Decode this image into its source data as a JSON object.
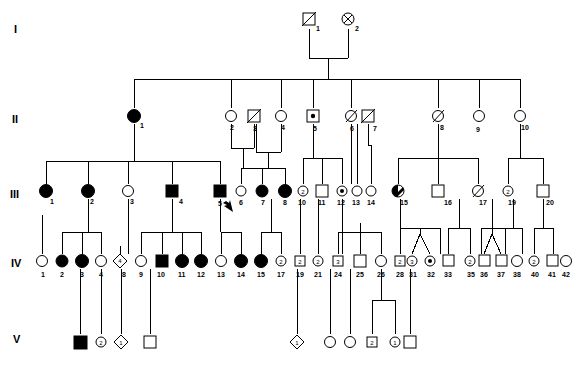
{
  "figure": {
    "type": "pedigree-chart",
    "title": "",
    "width": 576,
    "height": 366,
    "background": "#ffffff",
    "line_color": "#000000",
    "fill_affected": "#000000",
    "fill_unaffected": "#ffffff"
  },
  "generation_labels": [
    {
      "text": "I",
      "x": 14,
      "y": 32
    },
    {
      "text": "II",
      "x": 12,
      "y": 122
    },
    {
      "text": "III",
      "x": 10,
      "y": 197
    },
    {
      "text": "IV",
      "x": 11,
      "y": 266
    },
    {
      "text": "V",
      "x": 13,
      "y": 342
    }
  ],
  "legend_meaning": {
    "square": "male",
    "circle": "female",
    "diamond": "sex unknown",
    "filled": "affected",
    "open": "unaffected",
    "center_dot": "carrier",
    "diagonal_slash": "deceased",
    "circle_with_x": "deceased female",
    "half_filled": "partially affected",
    "number_inside": "number of individuals",
    "arrow": "proband"
  },
  "individuals": [
    {
      "gen": "I",
      "id": "1",
      "shape": "square",
      "fill": "open",
      "mark": "slash",
      "x": 309,
      "y": 19
    },
    {
      "gen": "I",
      "id": "2",
      "shape": "circle",
      "fill": "open",
      "mark": "cross",
      "x": 348,
      "y": 19
    },
    {
      "gen": "II",
      "id": "1",
      "shape": "circle",
      "fill": "filled",
      "mark": "none",
      "x": 134,
      "y": 116
    },
    {
      "gen": "II",
      "id": "2",
      "shape": "circle",
      "fill": "open",
      "mark": "none",
      "x": 231,
      "y": 116
    },
    {
      "gen": "II",
      "id": "3",
      "shape": "square",
      "fill": "open",
      "mark": "slash",
      "x": 254,
      "y": 116
    },
    {
      "gen": "II",
      "id": "4",
      "shape": "circle",
      "fill": "open",
      "mark": "none",
      "x": 281,
      "y": 116
    },
    {
      "gen": "II",
      "id": "5",
      "shape": "square",
      "fill": "open",
      "mark": "dot",
      "x": 313,
      "y": 116
    },
    {
      "gen": "II",
      "id": "6",
      "shape": "circle",
      "fill": "open",
      "mark": "slash",
      "x": 351,
      "y": 116
    },
    {
      "gen": "II",
      "id": "7",
      "shape": "square",
      "fill": "open",
      "mark": "slash",
      "x": 368,
      "y": 116
    },
    {
      "gen": "II",
      "id": "8",
      "shape": "circle",
      "fill": "open",
      "mark": "slash",
      "x": 438,
      "y": 116
    },
    {
      "gen": "II",
      "id": "9",
      "shape": "circle",
      "fill": "open",
      "mark": "none",
      "x": 479,
      "y": 116
    },
    {
      "gen": "II",
      "id": "10",
      "shape": "circle",
      "fill": "open",
      "mark": "none",
      "x": 520,
      "y": 116
    },
    {
      "gen": "III",
      "id": "1",
      "shape": "circle",
      "fill": "filled",
      "mark": "none",
      "x": 46,
      "y": 191
    },
    {
      "gen": "III",
      "id": "2",
      "shape": "circle",
      "fill": "filled",
      "mark": "none",
      "x": 88,
      "y": 191
    },
    {
      "gen": "III",
      "id": "3",
      "shape": "circle",
      "fill": "open",
      "mark": "none",
      "x": 128,
      "y": 191
    },
    {
      "gen": "III",
      "id": "4",
      "shape": "square",
      "fill": "filled",
      "mark": "none",
      "x": 172,
      "y": 191
    },
    {
      "gen": "III",
      "id": "5",
      "shape": "square",
      "fill": "filled",
      "mark": "proband",
      "x": 220,
      "y": 191
    },
    {
      "gen": "III",
      "id": "6",
      "shape": "circle",
      "fill": "open",
      "mark": "none",
      "x": 241,
      "y": 191
    },
    {
      "gen": "III",
      "id": "7",
      "shape": "circle",
      "fill": "filled",
      "mark": "none",
      "x": 262,
      "y": 191
    },
    {
      "gen": "III",
      "id": "8",
      "shape": "circle",
      "fill": "filled",
      "mark": "none",
      "x": 285,
      "y": 191
    },
    {
      "gen": "III",
      "id": "10",
      "shape": "circle",
      "fill": "open",
      "mark": "count",
      "count": "2",
      "x": 303,
      "y": 191
    },
    {
      "gen": "III",
      "id": "11",
      "shape": "square",
      "fill": "open",
      "mark": "none",
      "x": 322,
      "y": 191
    },
    {
      "gen": "III",
      "id": "12",
      "shape": "circle",
      "fill": "open",
      "mark": "dot",
      "x": 342,
      "y": 191
    },
    {
      "gen": "III",
      "id": "13",
      "shape": "circle",
      "fill": "open",
      "mark": "none",
      "x": 357,
      "y": 191
    },
    {
      "gen": "III",
      "id": "14",
      "shape": "circle",
      "fill": "open",
      "mark": "none",
      "x": 371,
      "y": 191
    },
    {
      "gen": "III",
      "id": "15",
      "shape": "circle",
      "fill": "half",
      "mark": "none",
      "x": 398,
      "y": 191
    },
    {
      "gen": "III",
      "id": "16",
      "shape": "square",
      "fill": "open",
      "mark": "none",
      "x": 438,
      "y": 191
    },
    {
      "gen": "III",
      "id": "17",
      "shape": "circle",
      "fill": "open",
      "mark": "slash",
      "x": 478,
      "y": 191
    },
    {
      "gen": "III",
      "id": "19",
      "shape": "circle",
      "fill": "open",
      "mark": "count",
      "count": "2",
      "x": 508,
      "y": 191
    },
    {
      "gen": "III",
      "id": "20",
      "shape": "square",
      "fill": "open",
      "mark": "none",
      "x": 543,
      "y": 191
    },
    {
      "gen": "IV",
      "id": "1",
      "shape": "circle",
      "fill": "open",
      "mark": "none",
      "x": 42,
      "y": 261
    },
    {
      "gen": "IV",
      "id": "2",
      "shape": "circle",
      "fill": "filled",
      "mark": "none",
      "x": 62,
      "y": 261
    },
    {
      "gen": "IV",
      "id": "3",
      "shape": "circle",
      "fill": "filled",
      "mark": "none",
      "x": 82,
      "y": 261
    },
    {
      "gen": "IV",
      "id": "4",
      "shape": "circle",
      "fill": "open",
      "mark": "none",
      "x": 101,
      "y": 261
    },
    {
      "gen": "IV",
      "id": "8",
      "shape": "diamond",
      "fill": "open",
      "mark": "count",
      "count": "4",
      "x": 120,
      "y": 261
    },
    {
      "gen": "IV",
      "id": "9",
      "shape": "circle",
      "fill": "open",
      "mark": "none",
      "x": 141,
      "y": 261
    },
    {
      "gen": "IV",
      "id": "10",
      "shape": "square",
      "fill": "filled",
      "mark": "none",
      "x": 162,
      "y": 261
    },
    {
      "gen": "IV",
      "id": "11",
      "shape": "circle",
      "fill": "filled",
      "mark": "none",
      "x": 182,
      "y": 261
    },
    {
      "gen": "IV",
      "id": "12",
      "shape": "circle",
      "fill": "filled",
      "mark": "none",
      "x": 201,
      "y": 261
    },
    {
      "gen": "IV",
      "id": "13",
      "shape": "circle",
      "fill": "open",
      "mark": "none",
      "x": 221,
      "y": 261
    },
    {
      "gen": "IV",
      "id": "14",
      "shape": "circle",
      "fill": "filled",
      "mark": "none",
      "x": 241,
      "y": 261
    },
    {
      "gen": "IV",
      "id": "15",
      "shape": "circle",
      "fill": "filled",
      "mark": "none",
      "x": 261,
      "y": 261
    },
    {
      "gen": "IV",
      "id": "17",
      "shape": "circle",
      "fill": "open",
      "mark": "count",
      "count": "2",
      "x": 281,
      "y": 261
    },
    {
      "gen": "IV",
      "id": "19",
      "shape": "square",
      "fill": "open",
      "mark": "count",
      "count": "2",
      "x": 300,
      "y": 261
    },
    {
      "gen": "IV",
      "id": "21",
      "shape": "circle",
      "fill": "open",
      "mark": "count",
      "count": "2",
      "x": 318,
      "y": 261
    },
    {
      "gen": "IV",
      "id": "24",
      "shape": "square",
      "fill": "open",
      "mark": "count",
      "count": "3",
      "x": 338,
      "y": 261
    },
    {
      "gen": "IV",
      "id": "25",
      "shape": "square",
      "fill": "open",
      "mark": "none",
      "x": 360,
      "y": 261
    },
    {
      "gen": "IV",
      "id": "26",
      "shape": "circle",
      "fill": "open",
      "mark": "none",
      "x": 381,
      "y": 261
    },
    {
      "gen": "IV",
      "id": "28",
      "shape": "square",
      "fill": "open",
      "mark": "count",
      "count": "2",
      "x": 400,
      "y": 261
    },
    {
      "gen": "IV",
      "id": "31",
      "shape": "circle",
      "fill": "open",
      "mark": "count",
      "count": "3",
      "x": 419,
      "y": 261
    },
    {
      "gen": "IV",
      "id": "32",
      "shape": "circle",
      "fill": "open",
      "mark": "dot",
      "x": 440,
      "y": 261
    },
    {
      "gen": "IV",
      "id": "33",
      "shape": "square",
      "fill": "open",
      "mark": "none",
      "x": 459,
      "y": 261
    },
    {
      "gen": "IV",
      "id": "35",
      "shape": "circle",
      "fill": "open",
      "mark": "count",
      "count": "2",
      "x": 481,
      "y": 261
    },
    {
      "gen": "IV",
      "id": "36",
      "shape": "square",
      "fill": "open",
      "mark": "none",
      "x": 502,
      "y": 261
    },
    {
      "gen": "IV",
      "id": "37",
      "shape": "square",
      "fill": "open",
      "mark": "none",
      "x": 521,
      "y": 261
    },
    {
      "gen": "IV",
      "id": "38",
      "shape": "circle",
      "fill": "open",
      "mark": "none",
      "x": 538,
      "y": 261
    },
    {
      "gen": "IV",
      "id": "40",
      "shape": "circle",
      "fill": "open",
      "mark": "count",
      "count": "2",
      "x": 552,
      "y": 261
    },
    {
      "gen": "IV",
      "id": "41",
      "shape": "square",
      "fill": "open",
      "mark": "none",
      "x": 566,
      "y": 261
    },
    {
      "gen": "IV",
      "id": "42",
      "shape": "circle",
      "fill": "open",
      "mark": "none",
      "x": 578,
      "y": 261
    },
    {
      "gen": "IV",
      "id": "43",
      "shape": "circle",
      "fill": "open",
      "mark": "none",
      "x": 592,
      "y": 261
    },
    {
      "gen": "V",
      "id": "1",
      "shape": "square",
      "fill": "filled",
      "mark": "none",
      "x": 80,
      "y": 342
    },
    {
      "gen": "V",
      "id": "2",
      "shape": "circle",
      "fill": "open",
      "mark": "count",
      "count": "2",
      "x": 101,
      "y": 342
    },
    {
      "gen": "V",
      "id": "3",
      "shape": "diamond",
      "fill": "open",
      "mark": "count",
      "count": "1",
      "x": 121,
      "y": 342
    },
    {
      "gen": "V",
      "id": "4",
      "shape": "square",
      "fill": "open",
      "mark": "none",
      "x": 150,
      "y": 342
    },
    {
      "gen": "V",
      "id": "5",
      "shape": "diamond",
      "fill": "open",
      "mark": "count",
      "count": "1",
      "x": 297,
      "y": 342
    },
    {
      "gen": "V",
      "id": "6",
      "shape": "circle",
      "fill": "open",
      "mark": "none",
      "x": 330,
      "y": 342
    },
    {
      "gen": "V",
      "id": "7",
      "shape": "circle",
      "fill": "open",
      "mark": "none",
      "x": 350,
      "y": 342
    },
    {
      "gen": "V",
      "id": "8",
      "shape": "square",
      "fill": "open",
      "mark": "count",
      "count": "2",
      "x": 372,
      "y": 342
    },
    {
      "gen": "V",
      "id": "9",
      "shape": "circle",
      "fill": "open",
      "mark": "count",
      "count": "1",
      "x": 395,
      "y": 342
    },
    {
      "gen": "V",
      "id": "10",
      "shape": "square",
      "fill": "open",
      "mark": "none",
      "x": 410,
      "y": 342
    }
  ],
  "id_labels_gen4": [
    "1",
    "2",
    "3",
    "4",
    "8",
    "9",
    "10",
    "11",
    "12",
    "13",
    "14",
    "15",
    "17",
    "19",
    "21",
    "24",
    "25",
    "26",
    "28",
    "31",
    "32",
    "33",
    "35",
    "36",
    "37",
    "38",
    "40",
    "41",
    "42",
    "43"
  ],
  "id_labels_gen3": [
    "1",
    "2",
    "3",
    "4",
    "5",
    "6",
    "7",
    "8",
    "10",
    "11",
    "12",
    "13",
    "14",
    "15",
    "16",
    "17",
    "19",
    "20"
  ],
  "notes": {
    "proband_marker": "arrow at III-5",
    "twin_pairs": [
      "IV-31 / IV-32",
      "IV-36 / IV-37"
    ]
  }
}
